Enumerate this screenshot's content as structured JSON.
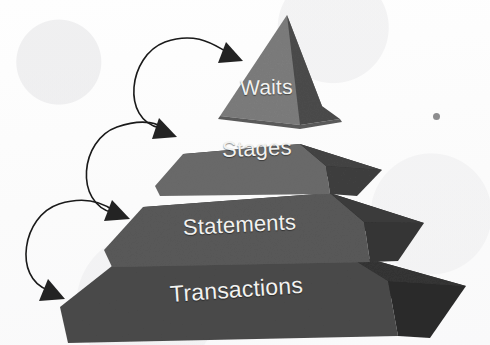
{
  "diagram": {
    "type": "pyramid",
    "orientation": "apex-top",
    "background_color": "#fdfdfd",
    "tier_count": 4,
    "arrow_count": 3,
    "arrowhead_count": 4,
    "tiers": [
      {
        "index": 1,
        "level": "top",
        "label": "Waits",
        "front_face_color": "#7c7c7c",
        "right_face_color": "#4b4b4b",
        "text_color": "#f2f2f0"
      },
      {
        "index": 2,
        "level": "second",
        "label": "Stages",
        "front_face_color": "#6a6a6a",
        "right_face_color": "#3f3f3f",
        "text_color": "#f2f2f0"
      },
      {
        "index": 3,
        "level": "third",
        "label": "Statements",
        "front_face_color": "#595959",
        "right_face_color": "#353535",
        "text_color": "#f2f2f0"
      },
      {
        "index": 4,
        "level": "base",
        "label": "Transactions",
        "front_face_color": "#4a4a4a",
        "right_face_color": "#2c2c2c",
        "text_color": "#f2f2f0"
      }
    ],
    "arrows": [
      {
        "index": 1,
        "target_tier_label": "Waits",
        "style": "curved",
        "color": "#1a1a1a"
      },
      {
        "index": 2,
        "target_tier_label": "Stages",
        "style": "curved",
        "color": "#1a1a1a"
      },
      {
        "index": 3,
        "target_tier_label": "Statements",
        "style": "curved",
        "color": "#1a1a1a"
      },
      {
        "index": 4,
        "target_tier_label": "Transactions",
        "style": "curved",
        "color": "#1a1a1a"
      }
    ],
    "artifacts": [
      {
        "name": "scan-speck",
        "shape": "dot",
        "color": "#6e6e70"
      }
    ]
  }
}
